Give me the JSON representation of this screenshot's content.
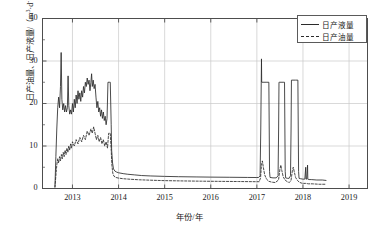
{
  "chart_data": {
    "type": "line",
    "title": "",
    "xlabel": "年份/年",
    "ylabel_text": "日产油量、日产液量/（m³·d-1）",
    "ylabel_part1": "日产油量、日产液量/（m",
    "ylabel_sup1": "3",
    "ylabel_mid": "·d",
    "ylabel_sup2": "-1",
    "ylabel_end": "）",
    "xlim": [
      2012.35,
      2019.4
    ],
    "ylim": [
      0,
      40
    ],
    "yticks": [
      0,
      10,
      20,
      30,
      40
    ],
    "ytick_labels": [
      "0",
      "10",
      "20",
      "30",
      "40"
    ],
    "xticks": [
      2013,
      2014,
      2015,
      2016,
      2017,
      2018,
      2019
    ],
    "xtick_labels": [
      "2013",
      "2014",
      "2015",
      "2016",
      "2017",
      "2018",
      "2019"
    ],
    "grid": true,
    "legend_position": "top-right",
    "colors": {
      "liquid_line": "#2b2b2b",
      "oil_line": "#2b2b2b",
      "axis": "#4d4d4d",
      "grid": "#c8c8c8",
      "background": "#ffffff"
    },
    "legend": [
      {
        "label": "日产液量",
        "style": "solid"
      },
      {
        "label": "日产油量",
        "style": "dashed"
      }
    ],
    "series": [
      {
        "name": "日产液量",
        "style": "solid",
        "points": [
          [
            2012.62,
            0.4
          ],
          [
            2012.64,
            7.5
          ],
          [
            2012.66,
            14.0
          ],
          [
            2012.68,
            19.0
          ],
          [
            2012.7,
            21.5
          ],
          [
            2012.72,
            19.0
          ],
          [
            2012.74,
            24.0
          ],
          [
            2012.755,
            32.0
          ],
          [
            2012.77,
            21.0
          ],
          [
            2012.79,
            18.5
          ],
          [
            2012.81,
            20.0
          ],
          [
            2012.83,
            18.0
          ],
          [
            2012.85,
            19.5
          ],
          [
            2012.87,
            18.0
          ],
          [
            2012.89,
            19.0
          ],
          [
            2012.905,
            26.5
          ],
          [
            2012.92,
            19.5
          ],
          [
            2012.94,
            17.5
          ],
          [
            2012.96,
            18.5
          ],
          [
            2012.98,
            17.5
          ],
          [
            2013.0,
            20.0
          ],
          [
            2013.02,
            18.0
          ],
          [
            2013.04,
            21.0
          ],
          [
            2013.06,
            19.0
          ],
          [
            2013.08,
            22.0
          ],
          [
            2013.1,
            20.0
          ],
          [
            2013.12,
            23.0
          ],
          [
            2013.14,
            21.0
          ],
          [
            2013.16,
            22.5
          ],
          [
            2013.18,
            20.5
          ],
          [
            2013.2,
            23.0
          ],
          [
            2013.22,
            21.5
          ],
          [
            2013.24,
            24.0
          ],
          [
            2013.26,
            22.5
          ],
          [
            2013.28,
            25.0
          ],
          [
            2013.3,
            24.0
          ],
          [
            2013.32,
            26.0
          ],
          [
            2013.34,
            24.5
          ],
          [
            2013.36,
            25.5
          ],
          [
            2013.38,
            23.0
          ],
          [
            2013.4,
            25.0
          ],
          [
            2013.415,
            27.0
          ],
          [
            2013.43,
            24.0
          ],
          [
            2013.45,
            25.5
          ],
          [
            2013.47,
            23.5
          ],
          [
            2013.49,
            24.5
          ],
          [
            2013.51,
            21.5
          ],
          [
            2013.53,
            19.0
          ],
          [
            2013.55,
            20.5
          ],
          [
            2013.57,
            18.0
          ],
          [
            2013.59,
            19.0
          ],
          [
            2013.61,
            17.0
          ],
          [
            2013.63,
            18.5
          ],
          [
            2013.65,
            16.5
          ],
          [
            2013.67,
            18.0
          ],
          [
            2013.69,
            16.0
          ],
          [
            2013.71,
            17.0
          ],
          [
            2013.73,
            15.0
          ],
          [
            2013.75,
            16.5
          ],
          [
            2013.77,
            25.0
          ],
          [
            2013.8,
            25.0
          ],
          [
            2013.82,
            25.0
          ],
          [
            2013.84,
            15.0
          ],
          [
            2013.85,
            9.0
          ],
          [
            2013.87,
            6.0
          ],
          [
            2013.89,
            4.6
          ],
          [
            2013.92,
            4.1
          ],
          [
            2013.96,
            3.85
          ],
          [
            2014.0,
            3.7
          ],
          [
            2014.1,
            3.5
          ],
          [
            2014.2,
            3.35
          ],
          [
            2014.35,
            3.2
          ],
          [
            2014.5,
            3.05
          ],
          [
            2014.7,
            2.95
          ],
          [
            2015.0,
            2.85
          ],
          [
            2015.3,
            2.78
          ],
          [
            2015.7,
            2.72
          ],
          [
            2016.0,
            2.68
          ],
          [
            2016.4,
            2.64
          ],
          [
            2016.8,
            2.6
          ],
          [
            2017.0,
            2.58
          ],
          [
            2017.04,
            2.6
          ],
          [
            2017.07,
            3.0
          ],
          [
            2017.085,
            14.0
          ],
          [
            2017.095,
            25.0
          ],
          [
            2017.1,
            30.5
          ],
          [
            2017.105,
            25.0
          ],
          [
            2017.11,
            25.0
          ],
          [
            2017.2,
            25.0
          ],
          [
            2017.26,
            25.0
          ],
          [
            2017.268,
            14.0
          ],
          [
            2017.275,
            4.0
          ],
          [
            2017.285,
            2.6
          ],
          [
            2017.35,
            2.5
          ],
          [
            2017.42,
            2.5
          ],
          [
            2017.46,
            3.0
          ],
          [
            2017.472,
            14.0
          ],
          [
            2017.48,
            25.0
          ],
          [
            2017.49,
            25.0
          ],
          [
            2017.57,
            25.0
          ],
          [
            2017.6,
            25.0
          ],
          [
            2017.608,
            14.0
          ],
          [
            2017.615,
            4.0
          ],
          [
            2017.625,
            2.5
          ],
          [
            2017.66,
            2.4
          ],
          [
            2017.7,
            2.4
          ],
          [
            2017.73,
            3.0
          ],
          [
            2017.742,
            14.0
          ],
          [
            2017.75,
            25.5
          ],
          [
            2017.76,
            25.5
          ],
          [
            2017.84,
            25.5
          ],
          [
            2017.89,
            25.5
          ],
          [
            2017.898,
            14.0
          ],
          [
            2017.905,
            4.0
          ],
          [
            2017.915,
            2.4
          ],
          [
            2017.95,
            2.3
          ],
          [
            2018.0,
            2.2
          ],
          [
            2018.04,
            2.2
          ],
          [
            2018.06,
            5.0
          ],
          [
            2018.065,
            2.2
          ],
          [
            2018.08,
            2.2
          ],
          [
            2018.1,
            5.5
          ],
          [
            2018.105,
            2.2
          ],
          [
            2018.13,
            2.1
          ],
          [
            2018.18,
            2.1
          ],
          [
            2018.3,
            2.0
          ],
          [
            2018.42,
            2.0
          ],
          [
            2018.5,
            1.9
          ]
        ]
      },
      {
        "name": "日产油量",
        "style": "dashed",
        "points": [
          [
            2012.62,
            0.3
          ],
          [
            2012.64,
            3.0
          ],
          [
            2012.66,
            5.5
          ],
          [
            2012.68,
            7.0
          ],
          [
            2012.7,
            6.0
          ],
          [
            2012.72,
            7.5
          ],
          [
            2012.74,
            6.5
          ],
          [
            2012.76,
            8.0
          ],
          [
            2012.78,
            7.0
          ],
          [
            2012.8,
            8.5
          ],
          [
            2012.82,
            7.5
          ],
          [
            2012.84,
            9.0
          ],
          [
            2012.86,
            8.0
          ],
          [
            2012.88,
            9.5
          ],
          [
            2012.9,
            8.5
          ],
          [
            2012.92,
            10.0
          ],
          [
            2012.94,
            9.0
          ],
          [
            2012.96,
            10.5
          ],
          [
            2012.98,
            9.5
          ],
          [
            2013.0,
            11.0
          ],
          [
            2013.04,
            10.0
          ],
          [
            2013.08,
            11.5
          ],
          [
            2013.12,
            10.5
          ],
          [
            2013.16,
            12.0
          ],
          [
            2013.2,
            11.0
          ],
          [
            2013.24,
            12.5
          ],
          [
            2013.28,
            11.5
          ],
          [
            2013.32,
            13.5
          ],
          [
            2013.36,
            12.5
          ],
          [
            2013.4,
            14.0
          ],
          [
            2013.43,
            13.0
          ],
          [
            2013.46,
            14.5
          ],
          [
            2013.49,
            13.0
          ],
          [
            2013.52,
            11.5
          ],
          [
            2013.55,
            12.5
          ],
          [
            2013.58,
            11.0
          ],
          [
            2013.61,
            12.0
          ],
          [
            2013.64,
            10.5
          ],
          [
            2013.67,
            11.5
          ],
          [
            2013.7,
            10.0
          ],
          [
            2013.73,
            11.0
          ],
          [
            2013.76,
            9.5
          ],
          [
            2013.785,
            13.0
          ],
          [
            2013.8,
            13.0
          ],
          [
            2013.82,
            13.0
          ],
          [
            2013.84,
            9.0
          ],
          [
            2013.855,
            5.5
          ],
          [
            2013.875,
            3.6
          ],
          [
            2013.9,
            2.9
          ],
          [
            2013.94,
            2.6
          ],
          [
            2014.0,
            2.45
          ],
          [
            2014.1,
            2.3
          ],
          [
            2014.25,
            2.18
          ],
          [
            2014.45,
            2.05
          ],
          [
            2014.7,
            1.95
          ],
          [
            2015.0,
            1.85
          ],
          [
            2015.4,
            1.78
          ],
          [
            2015.8,
            1.72
          ],
          [
            2016.2,
            1.68
          ],
          [
            2016.6,
            1.64
          ],
          [
            2017.0,
            1.6
          ],
          [
            2017.05,
            1.6
          ],
          [
            2017.08,
            2.5
          ],
          [
            2017.1,
            5.5
          ],
          [
            2017.12,
            6.5
          ],
          [
            2017.14,
            5.0
          ],
          [
            2017.17,
            3.2
          ],
          [
            2017.21,
            2.2
          ],
          [
            2017.26,
            1.7
          ],
          [
            2017.32,
            1.5
          ],
          [
            2017.4,
            1.4
          ],
          [
            2017.47,
            2.0
          ],
          [
            2017.5,
            4.5
          ],
          [
            2017.52,
            5.5
          ],
          [
            2017.54,
            4.3
          ],
          [
            2017.57,
            2.8
          ],
          [
            2017.61,
            2.0
          ],
          [
            2017.66,
            1.6
          ],
          [
            2017.7,
            1.4
          ],
          [
            2017.74,
            1.8
          ],
          [
            2017.77,
            4.2
          ],
          [
            2017.79,
            5.0
          ],
          [
            2017.81,
            4.0
          ],
          [
            2017.84,
            2.6
          ],
          [
            2017.88,
            1.9
          ],
          [
            2017.92,
            1.5
          ],
          [
            2017.96,
            1.3
          ],
          [
            2018.0,
            1.2
          ],
          [
            2018.06,
            1.2
          ],
          [
            2018.12,
            1.1
          ],
          [
            2018.2,
            1.1
          ],
          [
            2018.35,
            1.0
          ],
          [
            2018.5,
            1.0
          ]
        ]
      }
    ]
  }
}
